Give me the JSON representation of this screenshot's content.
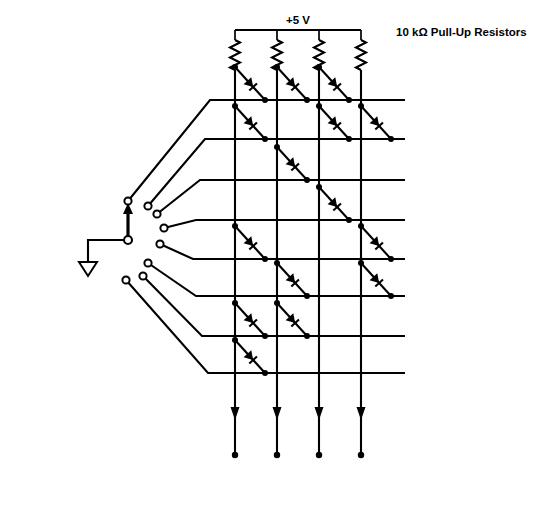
{
  "figure": {
    "caption": "(a)",
    "supply_label": "+5 V",
    "resistor_annotation": "10 kΩ Pull-Up Resistors",
    "switch_label_line1": "8-Position",
    "switch_label_line2": "Rotary Switch",
    "ground_symbol": "ground-triangle"
  },
  "rows": [
    {
      "label": "Row 0",
      "index": 0,
      "y": 100
    },
    {
      "label": "Row 1",
      "index": 1,
      "y": 139
    },
    {
      "label": "Row 2",
      "index": 2,
      "y": 180
    },
    {
      "label": "Row 3",
      "index": 3,
      "y": 220
    },
    {
      "label": "Row 4",
      "index": 4,
      "y": 259
    },
    {
      "label": "Row 5",
      "index": 5,
      "y": 296
    },
    {
      "label": "Row 6",
      "index": 6,
      "y": 336
    },
    {
      "label": "Row 7",
      "index": 7,
      "y": 373
    }
  ],
  "columns": [
    {
      "label": "D",
      "subscript": "3",
      "index": 3,
      "x": 235
    },
    {
      "label": "D",
      "subscript": "2",
      "index": 2,
      "x": 277
    },
    {
      "label": "D",
      "subscript": "1",
      "index": 1,
      "x": 319
    },
    {
      "label": "D",
      "subscript": "0",
      "index": 0,
      "x": 361
    }
  ],
  "switch_contacts": [
    {
      "label": "0",
      "cx": 128,
      "cy": 201,
      "num_x": 124,
      "num_y": 194
    },
    {
      "label": "1",
      "cx": 148,
      "cy": 206,
      "num_x": 145,
      "num_y": 198
    },
    {
      "label": "2",
      "cx": 157,
      "cy": 214,
      "num_x": 157,
      "num_y": 205
    },
    {
      "label": "3",
      "cx": 164,
      "cy": 228,
      "num_x": 168,
      "num_y": 221
    },
    {
      "label": "4",
      "cx": 160,
      "cy": 244,
      "num_x": 170,
      "num_y": 241
    },
    {
      "label": "5",
      "cx": 148,
      "cy": 263,
      "num_x": 156,
      "num_y": 262
    },
    {
      "label": "6",
      "cx": 143,
      "cy": 276,
      "num_x": 150,
      "num_y": 285
    },
    {
      "label": "7",
      "cx": 126,
      "cy": 280,
      "num_x": 132,
      "num_y": 292
    }
  ],
  "diode_matrix": {
    "description": "Diode present at row/column intersection",
    "encoding": [
      {
        "row": 0,
        "columns": [
          3,
          2,
          1
        ]
      },
      {
        "row": 1,
        "columns": [
          3,
          1,
          0
        ]
      },
      {
        "row": 2,
        "columns": [
          2
        ]
      },
      {
        "row": 3,
        "columns": [
          1
        ]
      },
      {
        "row": 4,
        "columns": [
          3,
          0
        ]
      },
      {
        "row": 5,
        "columns": [
          2,
          0
        ]
      },
      {
        "row": 6,
        "columns": [
          3,
          2
        ]
      },
      {
        "row": 7,
        "columns": [
          3
        ]
      }
    ]
  },
  "resistors": {
    "count": 4,
    "value": "10 kΩ",
    "type": "pull-up"
  }
}
